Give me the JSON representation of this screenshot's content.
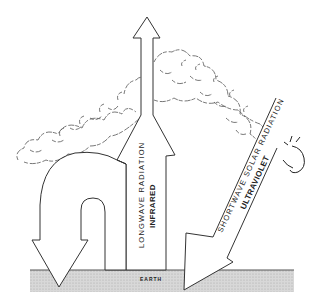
{
  "diagram": {
    "labels": {
      "longwave": "LONGWAVE  RADIATION",
      "infrared": "INFRARED",
      "shortwave": "SHORTWAVE  SOLAR  RADIATION",
      "ultraviolet": "ULTRAVIOLET",
      "earth": "EARTH"
    },
    "colors": {
      "line": "#333333",
      "ground": "#d4d4d4",
      "ground_edge": "#555555",
      "background": "#ffffff"
    },
    "icons": {
      "sun": "sun-scribble"
    }
  }
}
